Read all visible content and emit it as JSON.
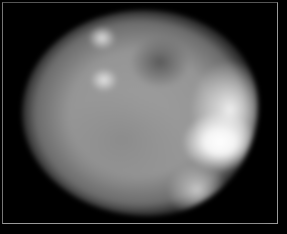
{
  "image": {
    "description": "Blurry grayscale astronomical image of a small planetary body framed by a thin gray border",
    "subject": "planetary-body",
    "colors": {
      "background": "#000000",
      "frame": "#9a9a9a",
      "brightest_region": "#ffffff",
      "mid_tone": "#959595",
      "dark_patch": "#5a5a5a"
    }
  }
}
